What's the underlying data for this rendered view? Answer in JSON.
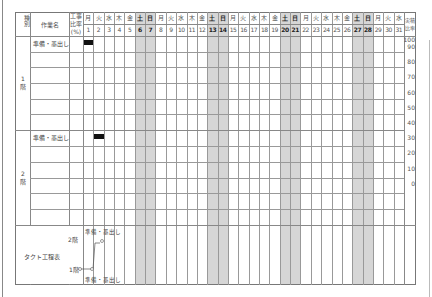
{
  "header": {
    "category_label": "種別",
    "task_name_label": "作業名",
    "work_ratio_label_line1": "工事",
    "work_ratio_label_line2": "比率",
    "work_ratio_label_line3": "(%)",
    "actual_ratio_label_line1": "実積",
    "actual_ratio_label_line2": "比率"
  },
  "days": [
    {
      "date": "1",
      "weekday": "月",
      "weekend": false
    },
    {
      "date": "2",
      "weekday": "火",
      "weekend": false
    },
    {
      "date": "3",
      "weekday": "水",
      "weekend": false
    },
    {
      "date": "4",
      "weekday": "木",
      "weekend": false
    },
    {
      "date": "5",
      "weekday": "金",
      "weekend": false
    },
    {
      "date": "6",
      "weekday": "土",
      "weekend": true
    },
    {
      "date": "7",
      "weekday": "日",
      "weekend": true
    },
    {
      "date": "8",
      "weekday": "月",
      "weekend": false
    },
    {
      "date": "9",
      "weekday": "火",
      "weekend": false
    },
    {
      "date": "10",
      "weekday": "水",
      "weekend": false
    },
    {
      "date": "11",
      "weekday": "木",
      "weekend": false
    },
    {
      "date": "12",
      "weekday": "金",
      "weekend": false
    },
    {
      "date": "13",
      "weekday": "土",
      "weekend": true
    },
    {
      "date": "14",
      "weekday": "日",
      "weekend": true
    },
    {
      "date": "15",
      "weekday": "月",
      "weekend": false
    },
    {
      "date": "16",
      "weekday": "火",
      "weekend": false
    },
    {
      "date": "17",
      "weekday": "水",
      "weekend": false
    },
    {
      "date": "18",
      "weekday": "木",
      "weekend": false
    },
    {
      "date": "19",
      "weekday": "金",
      "weekend": false
    },
    {
      "date": "20",
      "weekday": "土",
      "weekend": true
    },
    {
      "date": "21",
      "weekday": "日",
      "weekend": true
    },
    {
      "date": "22",
      "weekday": "月",
      "weekend": false
    },
    {
      "date": "23",
      "weekday": "火",
      "weekend": false
    },
    {
      "date": "24",
      "weekday": "水",
      "weekend": false
    },
    {
      "date": "25",
      "weekday": "木",
      "weekend": false
    },
    {
      "date": "26",
      "weekday": "金",
      "weekend": false
    },
    {
      "date": "27",
      "weekday": "土",
      "weekend": true
    },
    {
      "date": "28",
      "weekday": "日",
      "weekend": true
    },
    {
      "date": "29",
      "weekday": "月",
      "weekend": false
    },
    {
      "date": "30",
      "weekday": "火",
      "weekend": false
    },
    {
      "date": "31",
      "weekday": "水",
      "weekend": false
    }
  ],
  "sections": [
    {
      "category": "1階",
      "tasks": [
        {
          "name": "準備・墨出し",
          "bar_start_day": 1,
          "bar_days": 1
        }
      ]
    },
    {
      "category": "2階",
      "tasks": [
        {
          "name": "準備・墨出し",
          "bar_start_day": 2,
          "bar_days": 1
        }
      ]
    }
  ],
  "actual_ratio_scale": [
    "100",
    "90",
    "80",
    "70",
    "60",
    "50",
    "40",
    "30",
    "20",
    "10",
    "0"
  ],
  "takt": {
    "label": "タクト工程表",
    "floor_upper": "2階",
    "floor_lower": "1階",
    "task_upper": "準備・墨出し",
    "task_lower": "準備・墨出し"
  },
  "colors": {
    "grid": "#888888",
    "weekend_shade": "#d6d6d6",
    "bar": "#111111"
  }
}
